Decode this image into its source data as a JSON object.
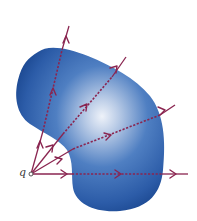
{
  "figure": {
    "charge_label": "q",
    "colors": {
      "surface_dark": "#1f4f9c",
      "surface_mid": "#3d6fb8",
      "surface_highlight": "#e8eef7",
      "field_line": "#8a2550",
      "charge_dot": "#555555"
    },
    "charge_position": [
      31,
      174
    ],
    "field_lines": [
      {
        "end": [
          69,
          26
        ],
        "inside_from": [
          43,
          131
        ],
        "inside_to": [
          62,
          50
        ]
      },
      {
        "end": [
          126,
          57
        ],
        "inside_from": [
          63,
          134
        ],
        "inside_to": [
          112,
          77
        ]
      },
      {
        "end": [
          175,
          105
        ],
        "inside_from": [
          73,
          149
        ],
        "inside_to": [
          160,
          115
        ]
      },
      {
        "end": [
          188,
          174
        ],
        "inside_from": [
          72,
          174
        ],
        "inside_to": [
          162,
          174
        ]
      }
    ]
  }
}
